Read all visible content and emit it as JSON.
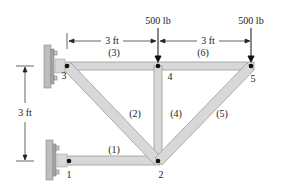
{
  "diagram": {
    "type": "truss",
    "loads": [
      {
        "joint": "4",
        "label": "500 lb"
      },
      {
        "joint": "5",
        "label": "500 lb"
      }
    ],
    "dimensions": {
      "span_3_4": "3 ft",
      "span_4_5": "3 ft",
      "height": "3 ft"
    },
    "joints": [
      "1",
      "2",
      "3",
      "4",
      "5"
    ],
    "members": [
      "(1)",
      "(2)",
      "(3)",
      "(4)",
      "(5)",
      "(6)"
    ],
    "colors": {
      "member_fill": "#d8d8d8",
      "member_stroke": "#9a9a9a",
      "wall_fill": "#bdbdbd",
      "text": "#222222"
    }
  }
}
